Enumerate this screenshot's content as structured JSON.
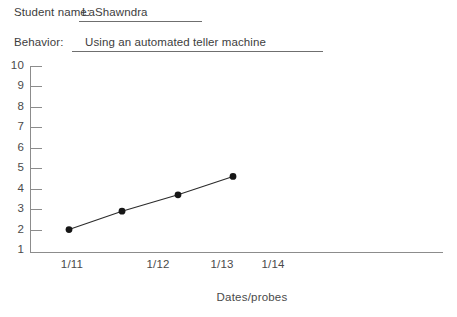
{
  "form": {
    "student_label": "Student name:",
    "student_value": "LaShawndra",
    "behavior_label": "Behavior:",
    "behavior_value": "Using an automated teller machine"
  },
  "chart_data": {
    "type": "line",
    "title": "",
    "xlabel": "Dates/probes",
    "ylabel": "",
    "categories": [
      "1/11",
      "1/12",
      "1/13",
      "1/14"
    ],
    "x_tick_labels": [
      "1/11",
      "1/12",
      "1/13",
      "1/14"
    ],
    "y_tick_labels": [
      "10",
      "9",
      "8",
      "7",
      "6",
      "5",
      "4",
      "3",
      "2",
      "1"
    ],
    "ylim": [
      1,
      10
    ],
    "grid": false,
    "legend": null,
    "series": [
      {
        "name": "Performance",
        "x": [
          "1/11",
          "1/11.5",
          "1/12",
          "1/12.6"
        ],
        "values": [
          2.0,
          2.9,
          3.7,
          4.6
        ]
      }
    ],
    "points": [
      {
        "label": "1/11",
        "value": 2.0
      },
      {
        "label": "",
        "value": 2.9
      },
      {
        "label": "",
        "value": 3.7
      },
      {
        "label": "",
        "value": 4.6
      }
    ],
    "marker_color": "#161616",
    "line_color": "#2b2b2b",
    "axis_color": "#8c8c8c"
  }
}
